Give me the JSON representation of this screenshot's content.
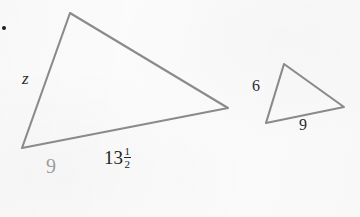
{
  "figure": {
    "kind": "similar-triangles-diagram",
    "background_color": "#fbfbfb",
    "stroke_color": "#8a8a8a",
    "stroke_width": 2.1,
    "bullet": {
      "name": "bullet-dot",
      "color": "#1d1d1d",
      "x": 3,
      "y": 27
    },
    "large_triangle": {
      "name": "large-triangle",
      "vertices": [
        {
          "id": "apex",
          "x": 70,
          "y": 13
        },
        {
          "id": "right",
          "x": 228,
          "y": 108
        },
        {
          "id": "bottom-left",
          "x": 22,
          "y": 148
        }
      ],
      "points_attr": "70,13 228,108 22,148",
      "labels": {
        "left_side": "z",
        "bottom_side": "13",
        "bottom_fraction_numerator": "1",
        "bottom_fraction_denominator": "2",
        "below_bottom": "9"
      }
    },
    "small_triangle": {
      "name": "small-triangle",
      "vertices": [
        {
          "id": "apex",
          "x": 284,
          "y": 64
        },
        {
          "id": "right",
          "x": 344,
          "y": 107
        },
        {
          "id": "bottom-left",
          "x": 266,
          "y": 123
        }
      ],
      "points_attr": "284,64 344,107 266,123",
      "labels": {
        "left_side": "6",
        "bottom_side": "9"
      }
    }
  }
}
